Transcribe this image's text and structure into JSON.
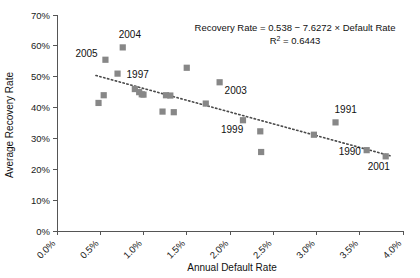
{
  "chart_data": {
    "type": "scatter",
    "title": "",
    "xlabel": "Annual Default Rate",
    "ylabel": "Average Recovery Rate",
    "xlim": [
      0.0,
      4.0
    ],
    "ylim": [
      0.0,
      70.0
    ],
    "grid": false,
    "legend": "none",
    "x_tick_labels": [
      "0.0%",
      "0.5%",
      "1.0%",
      "1.5%",
      "2.0%",
      "2.5%",
      "3.0%",
      "3.5%",
      "4.0%"
    ],
    "x_tick_values": [
      0.0,
      0.5,
      1.0,
      1.5,
      2.0,
      2.5,
      3.0,
      3.5,
      4.0
    ],
    "y_tick_labels": [
      "0%",
      "10%",
      "20%",
      "30%",
      "40%",
      "50%",
      "60%",
      "70%"
    ],
    "y_tick_values": [
      0,
      10,
      20,
      30,
      40,
      50,
      60,
      70
    ],
    "marker": "square",
    "marker_color": "#878787",
    "points": [
      {
        "x": 0.48,
        "y": 41.5,
        "label": ""
      },
      {
        "x": 0.54,
        "y": 44.0,
        "label": ""
      },
      {
        "x": 0.56,
        "y": 55.5,
        "label": "2005"
      },
      {
        "x": 0.76,
        "y": 59.5,
        "label": "2004"
      },
      {
        "x": 0.7,
        "y": 51.0,
        "label": "1997"
      },
      {
        "x": 0.9,
        "y": 46.0,
        "label": ""
      },
      {
        "x": 0.95,
        "y": 45.0,
        "label": ""
      },
      {
        "x": 0.98,
        "y": 44.3,
        "label": ""
      },
      {
        "x": 1.0,
        "y": 44.2,
        "label": ""
      },
      {
        "x": 1.22,
        "y": 38.7,
        "label": ""
      },
      {
        "x": 1.26,
        "y": 44.0,
        "label": ""
      },
      {
        "x": 1.31,
        "y": 43.9,
        "label": ""
      },
      {
        "x": 1.35,
        "y": 38.5,
        "label": ""
      },
      {
        "x": 1.5,
        "y": 52.9,
        "label": ""
      },
      {
        "x": 1.72,
        "y": 41.3,
        "label": ""
      },
      {
        "x": 1.88,
        "y": 48.2,
        "label": "2003"
      },
      {
        "x": 2.15,
        "y": 35.9,
        "label": "1999"
      },
      {
        "x": 2.35,
        "y": 32.3,
        "label": ""
      },
      {
        "x": 2.36,
        "y": 25.6,
        "label": ""
      },
      {
        "x": 2.97,
        "y": 31.2,
        "label": ""
      },
      {
        "x": 3.22,
        "y": 35.2,
        "label": "1991"
      },
      {
        "x": 3.58,
        "y": 26.2,
        "label": "1990"
      },
      {
        "x": 3.8,
        "y": 24.2,
        "label": "2001"
      }
    ],
    "trendline": {
      "slope": -7.6272,
      "intercept": 0.538,
      "x_start": 0.45,
      "x_end": 3.85,
      "y_start": 50.4,
      "y_end": 24.4,
      "style": "dotted"
    },
    "annotation": {
      "equation": "Recovery Rate = 0.538 − 7.6272 × Default Rate",
      "r_squared_prefix": "R",
      "r_squared_exponent": "2",
      "r_squared_value": " = 0.6443"
    },
    "label_offsets": {
      "2005": {
        "dx": -30,
        "dy": -3
      },
      "2004": {
        "dx": -4,
        "dy": -9
      },
      "1997": {
        "dx": 9,
        "dy": 4
      },
      "2003": {
        "dx": 5,
        "dy": 12
      },
      "1999": {
        "dx": -22,
        "dy": 13
      },
      "1991": {
        "dx": -1,
        "dy": -9
      },
      "1990": {
        "dx": -28,
        "dy": 5
      },
      "2001": {
        "dx": -18,
        "dy": 14
      }
    }
  }
}
